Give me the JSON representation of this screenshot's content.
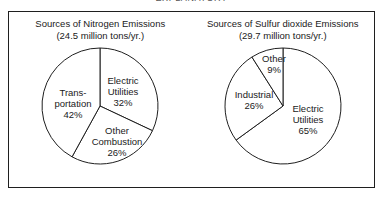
{
  "top_title": "EXPLANATORY",
  "colors": {
    "background": "#ffffff",
    "frame_border": "#1f1f1f",
    "slice_fill": "#ffffff",
    "slice_stroke": "#1f1f1f",
    "text": "#1a1a1a"
  },
  "charts": [
    {
      "id": "nitrogen",
      "title_line1": "Sources of Nitrogen Emissions",
      "title_line2": "(24.5 million tons/yr.)",
      "total_label": "24.5 million tons/yr.",
      "slices": [
        {
          "label_lines": [
            "Electric",
            "Utilities"
          ],
          "value_label": "32%",
          "value": 32
        },
        {
          "label_lines": [
            "Other",
            "Combustion"
          ],
          "value_label": "26%",
          "value": 26
        },
        {
          "label_lines": [
            "Trans-",
            "portation"
          ],
          "value_label": "42%",
          "value": 42
        }
      ]
    },
    {
      "id": "sulfur",
      "title_line1": "Sources of Sulfur dioxide Emissions",
      "title_line2": "(29.7 million tons/yr.)",
      "total_label": "29.7 million tons/yr.",
      "slices": [
        {
          "label_lines": [
            "Electric",
            "Utilities"
          ],
          "value_label": "65%",
          "value": 65
        },
        {
          "label_lines": [
            "Industrial"
          ],
          "value_label": "26%",
          "value": 26
        },
        {
          "label_lines": [
            "Other"
          ],
          "value_label": "9%",
          "value": 9
        }
      ]
    }
  ],
  "chart_data": [
    {
      "type": "pie",
      "title": "Sources of Nitrogen Emissions (24.5 million tons/yr.)",
      "subtitle": "(24.5 million tons/yr.)",
      "unit": "percent of total",
      "total": 24.5,
      "total_unit": "million tons/yr.",
      "start_angle_deg": 0,
      "direction": "clockwise",
      "labels": [
        "Electric Utilities",
        "Other Combustion",
        "Transportation"
      ],
      "values": [
        32,
        26,
        42
      ],
      "data_labels": [
        "32%",
        "26%",
        "42%"
      ],
      "legend": "none",
      "grid": false
    },
    {
      "type": "pie",
      "title": "Sources of Sulfur dioxide Emissions (29.7 million tons/yr.)",
      "subtitle": "(29.7 million tons/yr.)",
      "unit": "percent of total",
      "total": 29.7,
      "total_unit": "million tons/yr.",
      "start_angle_deg": 0,
      "direction": "clockwise",
      "labels": [
        "Electric Utilities",
        "Industrial",
        "Other"
      ],
      "values": [
        65,
        26,
        9
      ],
      "data_labels": [
        "65%",
        "26%",
        "9%"
      ],
      "legend": "none",
      "grid": false
    }
  ]
}
